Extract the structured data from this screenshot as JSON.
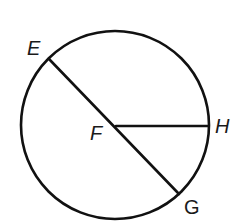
{
  "diagram": {
    "type": "circle-geometry",
    "colors": {
      "stroke": "#111111",
      "label": "#1a1a1a",
      "background": "#ffffff"
    },
    "circle": {
      "center_label": "F",
      "cx": 115,
      "cy": 125,
      "r": 94
    },
    "points": {
      "E": {
        "label": "E",
        "x": 49,
        "y": 59
      },
      "F": {
        "label": "F",
        "x": 116,
        "y": 126
      },
      "G": {
        "label": "G",
        "x": 179,
        "y": 194
      },
      "H": {
        "label": "H",
        "x": 208,
        "y": 126
      }
    },
    "segments": [
      {
        "name": "diameter-EG",
        "from": "E",
        "to": "G"
      },
      {
        "name": "radius-FH",
        "from": "F",
        "to": "H"
      }
    ],
    "labels": {
      "E": "E",
      "F": "F",
      "G": "G",
      "H": "H"
    }
  }
}
